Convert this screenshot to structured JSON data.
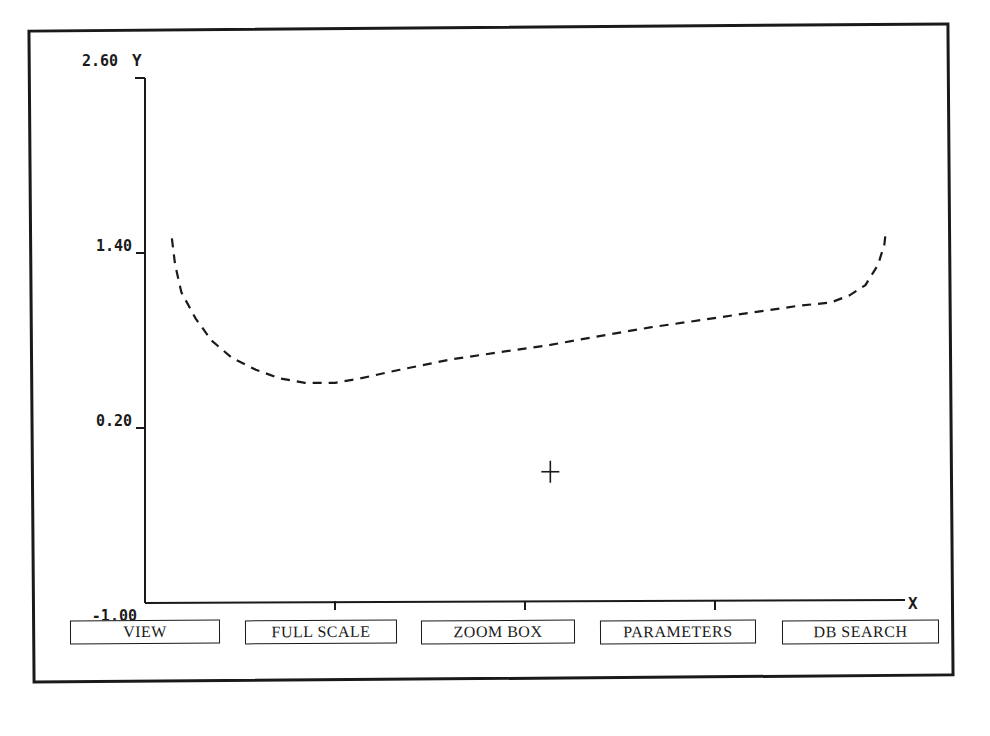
{
  "chart_data": {
    "type": "line",
    "title": "",
    "xlabel": "X",
    "ylabel": "Y",
    "xlim": [
      0.3,
      5.1
    ],
    "ylim": [
      -1.0,
      2.6
    ],
    "x_ticks": [
      "0.30",
      "1.50",
      "2.70",
      "3.90",
      "5.10"
    ],
    "x_tick_values": [
      0.3,
      1.5,
      2.7,
      3.9,
      5.1
    ],
    "y_ticks": [
      "-1.00",
      "0.20",
      "1.40",
      "2.60"
    ],
    "y_tick_values": [
      -1.0,
      0.2,
      1.4,
      2.6
    ],
    "grid": false,
    "line_style": "dashed",
    "series": [
      {
        "name": "curve",
        "x": [
          0.47,
          0.49,
          0.53,
          0.62,
          0.72,
          0.85,
          1.0,
          1.15,
          1.31,
          1.5,
          1.66,
          1.91,
          2.23,
          2.54,
          2.86,
          3.17,
          3.49,
          3.81,
          4.12,
          4.44,
          4.63,
          4.75,
          4.85,
          4.93,
          4.97,
          4.98
        ],
        "y": [
          1.5,
          1.32,
          1.13,
          0.95,
          0.8,
          0.68,
          0.6,
          0.54,
          0.51,
          0.51,
          0.54,
          0.6,
          0.67,
          0.72,
          0.77,
          0.83,
          0.89,
          0.94,
          0.99,
          1.04,
          1.06,
          1.11,
          1.18,
          1.32,
          1.46,
          1.56
        ]
      }
    ],
    "cursor": {
      "x": 2.86,
      "y": -0.1
    }
  },
  "buttons": [
    {
      "label": "VIEW"
    },
    {
      "label": "FULL SCALE"
    },
    {
      "label": "ZOOM BOX"
    },
    {
      "label": "PARAMETERS"
    },
    {
      "label": "DB SEARCH"
    }
  ]
}
